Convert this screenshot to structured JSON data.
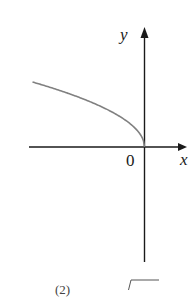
{
  "figure": {
    "axes": {
      "x_label": "x",
      "y_label": "y",
      "origin_label": "0",
      "axis_color": "#1a1a1a",
      "curve_color": "#808080"
    },
    "curve": {
      "equation": "y = sqrt(-x)",
      "description": "Concave curve in the second quadrant approaching the origin vertically"
    },
    "next_item_label": "(2)"
  },
  "chart_data": {
    "type": "line",
    "title": "",
    "xlabel": "x",
    "ylabel": "y",
    "series": [
      {
        "name": "y = sqrt(-x)",
        "x": [
          -112,
          -100,
          -80,
          -60,
          -40,
          -20,
          -10,
          -5,
          -1,
          0
        ],
        "y": [
          10.58,
          10.0,
          8.94,
          7.75,
          6.32,
          4.47,
          3.16,
          2.24,
          1.0,
          0
        ]
      }
    ],
    "tick_labels": [
      "0"
    ],
    "grid": false,
    "legend": "none"
  }
}
